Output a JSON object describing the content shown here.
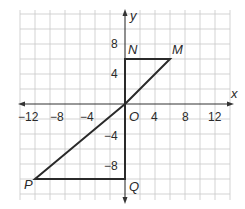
{
  "diagram": {
    "type": "coordinate-plane",
    "axes": {
      "x_label": "x",
      "y_label": "y",
      "origin_label": "O",
      "x_ticks": [
        {
          "value": -12,
          "label": "−12"
        },
        {
          "value": -8,
          "label": "−8"
        },
        {
          "value": -4,
          "label": "−4"
        },
        {
          "value": 4,
          "label": "4"
        },
        {
          "value": 8,
          "label": "8"
        },
        {
          "value": 12,
          "label": "12"
        }
      ],
      "y_ticks": [
        {
          "value": 8,
          "label": "8"
        },
        {
          "value": 4,
          "label": "4"
        },
        {
          "value": -4,
          "label": "−4"
        },
        {
          "value": -8,
          "label": "−8"
        }
      ],
      "grid_unit": 2,
      "x_range": [
        -14,
        14
      ],
      "y_range": [
        -12,
        12
      ]
    },
    "points": {
      "N": {
        "label": "N",
        "x": 0,
        "y": 6
      },
      "M": {
        "label": "M",
        "x": 6,
        "y": 6
      },
      "O": {
        "label": "O",
        "x": 0,
        "y": 0
      },
      "P": {
        "label": "P",
        "x": -12,
        "y": -10
      },
      "Q": {
        "label": "Q",
        "x": 0,
        "y": -10
      }
    },
    "triangles": [
      {
        "name": "triangle-NMO",
        "vertices": [
          "N",
          "M",
          "O"
        ]
      },
      {
        "name": "triangle-PQO",
        "vertices": [
          "P",
          "Q",
          "O"
        ]
      }
    ]
  }
}
